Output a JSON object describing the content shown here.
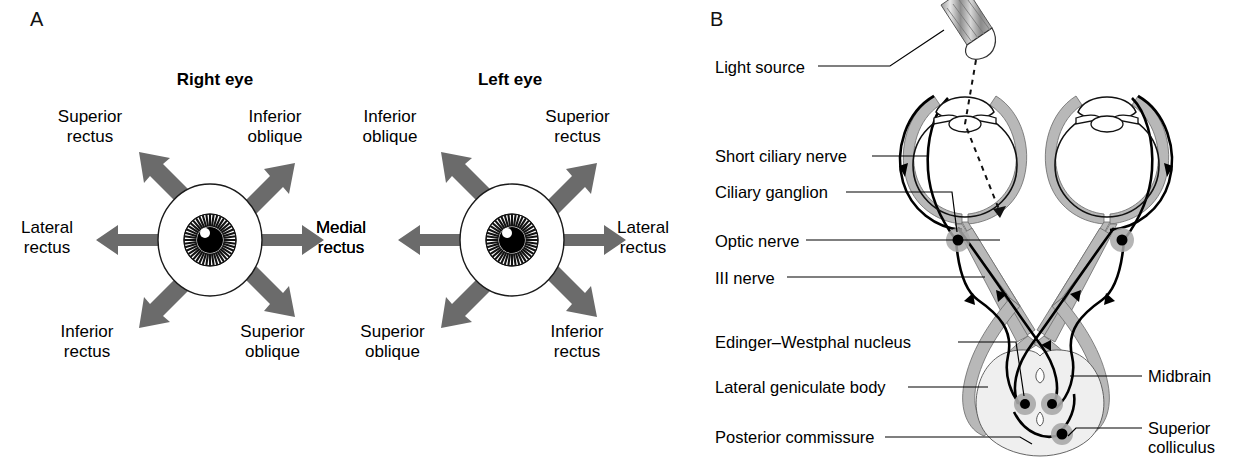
{
  "figure": {
    "panel_a_letter": "A",
    "panel_b_letter": "B",
    "arrow_color": "#6b6b6b",
    "nerve_fill_color": "#b8b8b8",
    "midbrain_fill_color": "#efefef",
    "ganglion_fill_color": "#a8a8a8",
    "line_color": "#000000"
  },
  "panel_a": {
    "right_eye": {
      "title": "Right eye",
      "labels": {
        "up_left": "Superior\nrectus",
        "up_right": "Inferior\noblique",
        "left": "Lateral\nrectus",
        "right": "Medial\nrectus",
        "down_left": "Inferior\nrectus",
        "down_right": "Superior\noblique"
      },
      "labels_flat": [
        {
          "dir": "up-left",
          "line1": "Superior",
          "line2": "rectus"
        },
        {
          "dir": "up-right",
          "line1": "Inferior",
          "line2": "oblique"
        },
        {
          "dir": "left",
          "line1": "Lateral",
          "line2": "rectus"
        },
        {
          "dir": "right",
          "line1": "Medial",
          "line2": "rectus"
        },
        {
          "dir": "down-left",
          "line1": "Inferior",
          "line2": "rectus"
        },
        {
          "dir": "down-right",
          "line1": "Superior",
          "line2": "oblique"
        }
      ]
    },
    "left_eye": {
      "title": "Left eye",
      "labels_flat": [
        {
          "dir": "up-left",
          "line1": "Inferior",
          "line2": "oblique"
        },
        {
          "dir": "up-right",
          "line1": "Superior",
          "line2": "rectus"
        },
        {
          "dir": "left",
          "line1": "Medial",
          "line2": "rectus"
        },
        {
          "dir": "right",
          "line1": "Lateral",
          "line2": "rectus"
        },
        {
          "dir": "down-left",
          "line1": "Superior",
          "line2": "oblique"
        },
        {
          "dir": "down-right",
          "line1": "Inferior",
          "line2": "rectus"
        }
      ]
    }
  },
  "panel_b": {
    "labels_left": [
      {
        "id": "light-source",
        "text": "Light source"
      },
      {
        "id": "short-ciliary-nerve",
        "text": "Short ciliary nerve"
      },
      {
        "id": "ciliary-ganglion",
        "text": "Ciliary ganglion"
      },
      {
        "id": "optic-nerve",
        "text": "Optic nerve"
      },
      {
        "id": "third-nerve",
        "text": "III nerve"
      },
      {
        "id": "edinger-westphal",
        "text": "Edinger–Westphal nucleus"
      },
      {
        "id": "lateral-geniculate",
        "text": "Lateral geniculate body"
      },
      {
        "id": "posterior-commissure",
        "text": "Posterior commissure"
      }
    ],
    "labels_right": [
      {
        "id": "midbrain",
        "line1": "Midbrain",
        "line2": ""
      },
      {
        "id": "superior-colliculus",
        "line1": "Superior",
        "line2": "colliculus"
      }
    ]
  }
}
